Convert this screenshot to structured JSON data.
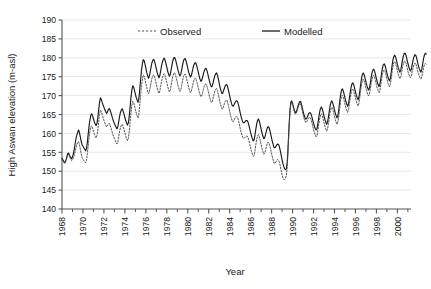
{
  "chart_data": {
    "type": "line",
    "title": "",
    "xlabel": "Year",
    "ylabel": "High Aswan elevation (m-asl)",
    "xlim": [
      1968,
      2001.3
    ],
    "ylim": [
      140,
      190
    ],
    "yticks": [
      140,
      145,
      150,
      155,
      160,
      165,
      170,
      175,
      180,
      185,
      190
    ],
    "xticks": [
      1968,
      1970,
      1972,
      1974,
      1976,
      1978,
      1980,
      1982,
      1984,
      1986,
      1988,
      1990,
      1992,
      1994,
      1996,
      1998,
      2000
    ],
    "xminorticks": [
      1969,
      1971,
      1973,
      1975,
      1977,
      1979,
      1981,
      1983,
      1985,
      1987,
      1989,
      1991,
      1993,
      1995,
      1997,
      1999,
      2001
    ],
    "grid": "horizontal",
    "legend_position": "top-inside",
    "legend": [
      {
        "name": "Observed",
        "style": "dashed",
        "color": "#4d4d4d"
      },
      {
        "name": "Modelled",
        "style": "solid",
        "color": "#1a1a1a"
      }
    ],
    "x_start": 1968.0,
    "x_step": 0.08333,
    "series": [
      {
        "name": "Modelled",
        "style": "solid",
        "color": "#1a1a1a",
        "values": [
          153.4,
          153.0,
          152.6,
          152.3,
          152.6,
          153.3,
          154.2,
          154.8,
          154.6,
          154.0,
          153.6,
          153.3,
          153.8,
          154.6,
          155.8,
          157.2,
          158.6,
          159.6,
          160.3,
          160.9,
          160.2,
          159.0,
          157.9,
          157.0,
          156.6,
          156.2,
          155.8,
          155.4,
          155.9,
          157.6,
          159.8,
          162.0,
          163.6,
          164.8,
          165.2,
          164.7,
          163.8,
          163.1,
          162.5,
          162.1,
          162.6,
          164.1,
          166.3,
          168.2,
          169.4,
          169.0,
          168.2,
          167.5,
          166.9,
          166.3,
          165.8,
          165.3,
          165.7,
          166.2,
          166.6,
          166.2,
          165.5,
          164.7,
          163.9,
          163.2,
          162.6,
          162.1,
          161.6,
          161.2,
          161.8,
          163.2,
          164.6,
          165.6,
          166.2,
          166.5,
          165.9,
          165.1,
          164.2,
          163.4,
          162.7,
          162.2,
          162.8,
          164.6,
          167.0,
          169.6,
          171.5,
          172.6,
          172.3,
          171.4,
          170.4,
          169.5,
          168.8,
          168.2,
          169.2,
          171.6,
          174.2,
          176.6,
          178.4,
          179.5,
          179.3,
          178.4,
          177.3,
          176.2,
          175.3,
          174.6,
          175.1,
          176.3,
          177.6,
          178.7,
          179.4,
          179.6,
          179.0,
          178.1,
          177.1,
          176.1,
          175.3,
          174.7,
          175.3,
          176.6,
          177.9,
          178.9,
          179.6,
          179.9,
          179.4,
          178.5,
          177.5,
          176.5,
          175.7,
          175.1,
          175.6,
          176.9,
          178.2,
          179.3,
          180.0,
          180.1,
          179.5,
          178.6,
          177.6,
          176.6,
          175.8,
          175.2,
          175.6,
          176.8,
          178.0,
          179.1,
          179.7,
          179.8,
          179.2,
          178.3,
          177.3,
          176.3,
          175.5,
          174.9,
          175.2,
          176.2,
          177.2,
          178.1,
          178.6,
          178.7,
          178.1,
          177.2,
          176.2,
          175.2,
          174.4,
          173.8,
          174.0,
          174.9,
          175.8,
          176.6,
          177.1,
          177.2,
          176.6,
          175.7,
          174.7,
          173.7,
          172.9,
          172.3,
          172.5,
          173.4,
          174.4,
          175.3,
          175.8,
          176.0,
          175.4,
          174.4,
          173.3,
          172.2,
          171.3,
          170.6,
          170.6,
          171.3,
          172.0,
          172.6,
          172.9,
          172.8,
          172.0,
          171.0,
          169.9,
          168.9,
          168.0,
          167.3,
          167.2,
          167.6,
          168.1,
          168.5,
          168.6,
          168.4,
          167.6,
          166.6,
          165.5,
          164.5,
          163.7,
          163.0,
          162.8,
          162.9,
          163.2,
          163.4,
          163.4,
          163.0,
          162.2,
          161.2,
          160.2,
          159.3,
          158.6,
          158.0,
          158.3,
          159.6,
          161.2,
          162.6,
          163.5,
          163.8,
          163.2,
          162.2,
          161.1,
          160.1,
          159.3,
          158.6,
          158.8,
          159.6,
          160.6,
          161.4,
          161.8,
          161.6,
          160.8,
          159.8,
          158.7,
          157.7,
          156.9,
          156.2,
          156.2,
          156.6,
          157.0,
          157.2,
          157.0,
          156.4,
          155.4,
          154.2,
          153.0,
          152.0,
          151.2,
          150.6,
          150.4,
          150.7,
          152.6,
          157.0,
          162.0,
          166.0,
          168.2,
          168.6,
          168.0,
          167.0,
          166.2,
          165.5,
          165.6,
          166.2,
          167.0,
          167.8,
          168.3,
          168.5,
          167.9,
          166.9,
          165.9,
          165.0,
          164.3,
          163.8,
          163.9,
          164.4,
          165.0,
          165.4,
          165.5,
          165.2,
          164.5,
          163.6,
          162.7,
          161.9,
          161.3,
          160.9,
          161.3,
          162.6,
          164.2,
          165.6,
          166.6,
          167.0,
          166.5,
          165.6,
          164.6,
          163.7,
          163.0,
          162.4,
          162.9,
          164.2,
          165.8,
          167.2,
          168.2,
          168.6,
          168.1,
          167.2,
          166.2,
          165.3,
          164.6,
          164.1,
          164.8,
          166.4,
          168.4,
          170.2,
          171.4,
          171.8,
          171.3,
          170.4,
          169.4,
          168.5,
          167.8,
          167.2,
          167.8,
          169.2,
          170.8,
          172.2,
          173.1,
          173.4,
          172.9,
          172.0,
          171.0,
          170.1,
          169.4,
          168.9,
          169.6,
          171.2,
          173.0,
          174.6,
          175.6,
          176.0,
          175.5,
          174.6,
          173.6,
          172.7,
          172.0,
          171.5,
          172.0,
          173.3,
          174.8,
          176.0,
          176.8,
          177.0,
          176.4,
          175.5,
          174.5,
          173.6,
          172.9,
          172.4,
          173.0,
          174.4,
          176.0,
          177.4,
          178.2,
          178.4,
          177.9,
          177.0,
          176.0,
          175.1,
          174.4,
          173.9,
          174.6,
          176.2,
          178.0,
          179.5,
          180.4,
          180.7,
          180.2,
          179.3,
          178.3,
          177.4,
          176.7,
          176.2,
          176.8,
          178.2,
          179.6,
          180.6,
          181.2,
          181.2,
          180.6,
          179.6,
          178.6,
          177.7,
          177.0,
          176.5,
          177.0,
          178.2,
          179.4,
          180.3,
          180.8,
          180.7,
          180.0,
          179.0,
          178.0,
          177.2,
          176.6,
          176.2,
          177.0,
          178.4,
          179.8,
          180.8,
          181.2,
          181.0
        ]
      },
      {
        "name": "Observed",
        "style": "dashed",
        "color": "#4d4d4d",
        "values": [
          153.2,
          152.8,
          152.4,
          152.0,
          152.3,
          153.0,
          153.9,
          154.5,
          154.3,
          153.7,
          153.2,
          152.8,
          153.0,
          153.4,
          154.2,
          155.2,
          156.2,
          157.0,
          157.6,
          157.8,
          157.0,
          155.8,
          154.6,
          153.6,
          153.2,
          152.8,
          152.5,
          152.2,
          152.8,
          154.6,
          156.8,
          159.0,
          160.6,
          161.8,
          162.0,
          161.4,
          160.5,
          159.8,
          159.2,
          158.8,
          159.4,
          160.9,
          163.1,
          165.0,
          166.2,
          165.8,
          165.0,
          164.2,
          163.5,
          162.8,
          162.2,
          161.7,
          162.0,
          162.4,
          162.7,
          162.2,
          161.5,
          160.7,
          159.9,
          159.2,
          158.6,
          158.1,
          157.6,
          157.2,
          157.8,
          159.2,
          160.6,
          161.6,
          162.2,
          162.4,
          161.8,
          161.0,
          160.1,
          159.3,
          158.6,
          158.1,
          158.7,
          160.5,
          162.9,
          165.5,
          167.4,
          168.5,
          168.2,
          167.3,
          166.3,
          165.4,
          164.7,
          164.1,
          165.1,
          167.5,
          170.1,
          172.5,
          174.3,
          175.4,
          175.2,
          174.3,
          173.2,
          172.1,
          171.2,
          170.5,
          171.0,
          172.2,
          173.5,
          174.6,
          175.3,
          175.5,
          174.9,
          174.0,
          173.0,
          172.0,
          171.2,
          170.6,
          171.2,
          172.5,
          173.8,
          174.8,
          175.5,
          175.8,
          175.3,
          174.4,
          173.4,
          172.4,
          171.6,
          171.0,
          171.5,
          172.8,
          174.1,
          175.2,
          175.9,
          176.0,
          175.4,
          174.5,
          173.5,
          172.5,
          171.7,
          171.1,
          171.5,
          172.7,
          173.9,
          175.0,
          175.6,
          175.7,
          175.1,
          174.2,
          173.2,
          172.2,
          171.4,
          170.8,
          171.1,
          172.1,
          173.1,
          174.0,
          174.5,
          174.6,
          174.0,
          173.1,
          172.1,
          171.1,
          170.3,
          169.7,
          169.9,
          170.8,
          171.7,
          172.5,
          173.0,
          173.1,
          172.5,
          171.6,
          170.6,
          169.6,
          168.8,
          168.2,
          168.4,
          169.3,
          170.3,
          171.2,
          171.7,
          171.9,
          171.3,
          170.3,
          169.2,
          168.1,
          167.2,
          166.5,
          166.5,
          167.2,
          167.9,
          168.5,
          168.8,
          168.7,
          167.9,
          166.9,
          165.8,
          164.8,
          163.9,
          163.2,
          163.1,
          163.5,
          164.0,
          164.4,
          164.5,
          164.3,
          163.5,
          162.5,
          161.4,
          160.4,
          159.6,
          158.9,
          158.7,
          158.8,
          159.1,
          159.3,
          159.3,
          158.9,
          158.1,
          157.1,
          156.1,
          155.2,
          154.5,
          153.9,
          154.2,
          155.5,
          157.1,
          158.5,
          159.4,
          159.7,
          159.1,
          158.1,
          157.0,
          156.0,
          155.2,
          154.5,
          154.7,
          155.5,
          156.5,
          157.3,
          157.7,
          157.5,
          156.7,
          155.7,
          154.6,
          153.6,
          152.8,
          152.1,
          152.1,
          152.5,
          152.9,
          153.1,
          152.9,
          152.3,
          151.3,
          150.1,
          149.0,
          148.2,
          147.8,
          147.8,
          148.2,
          149.0,
          151.5,
          156.2,
          161.4,
          165.5,
          167.8,
          168.2,
          167.6,
          166.6,
          165.8,
          165.1,
          165.2,
          165.8,
          166.6,
          167.3,
          167.7,
          167.8,
          167.1,
          166.1,
          165.0,
          164.1,
          163.4,
          162.9,
          163.0,
          163.4,
          163.9,
          164.2,
          164.2,
          163.8,
          163.0,
          162.0,
          161.0,
          160.2,
          159.6,
          159.1,
          159.5,
          160.8,
          162.4,
          163.8,
          164.8,
          165.2,
          164.7,
          163.8,
          162.8,
          161.9,
          161.2,
          160.6,
          161.1,
          162.4,
          164.0,
          165.5,
          166.5,
          166.9,
          166.4,
          165.5,
          164.5,
          163.6,
          162.9,
          162.4,
          163.1,
          164.7,
          166.7,
          168.5,
          169.7,
          170.1,
          169.6,
          168.7,
          167.7,
          166.8,
          166.1,
          165.6,
          166.2,
          167.6,
          169.2,
          170.6,
          171.5,
          171.8,
          171.3,
          170.4,
          169.4,
          168.5,
          167.8,
          167.3,
          168.0,
          169.6,
          171.4,
          173.0,
          174.0,
          174.4,
          173.9,
          173.0,
          172.0,
          171.1,
          170.4,
          169.9,
          170.4,
          171.7,
          173.2,
          174.4,
          175.2,
          175.4,
          174.8,
          173.9,
          172.9,
          172.0,
          171.3,
          170.8,
          171.4,
          172.8,
          174.4,
          175.8,
          176.6,
          176.8,
          176.3,
          175.4,
          174.4,
          173.5,
          172.8,
          172.3,
          173.0,
          174.5,
          176.3,
          177.8,
          178.7,
          179.0,
          178.5,
          177.6,
          176.6,
          175.7,
          175.0,
          174.5,
          175.0,
          176.3,
          177.6,
          178.6,
          179.1,
          179.1,
          178.5,
          177.5,
          176.5,
          175.7,
          175.1,
          174.7,
          175.2,
          176.3,
          177.4,
          178.2,
          178.6,
          178.5,
          177.8,
          176.8,
          175.9,
          175.2,
          174.7,
          174.4,
          175.0,
          176.2,
          177.4,
          178.2,
          178.5,
          178.2
        ]
      }
    ]
  },
  "axis": {
    "ylabel": "High Aswan elevation (m-asl)",
    "xlabel": "Year"
  },
  "legend": {
    "observed": "Observed",
    "modelled": "Modelled"
  }
}
